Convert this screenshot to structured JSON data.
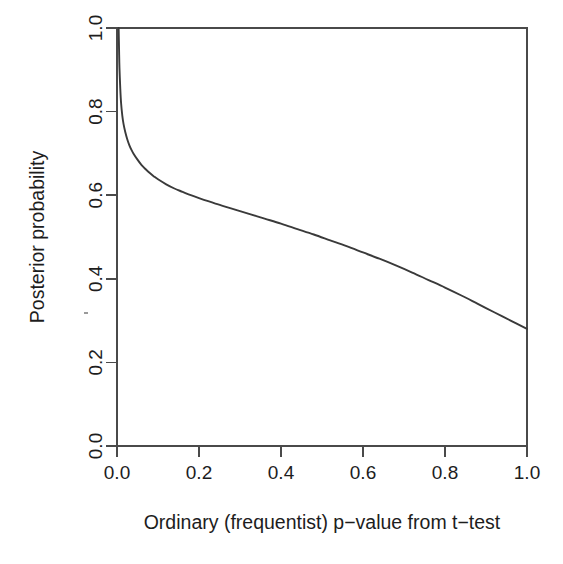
{
  "chart_data": {
    "type": "line",
    "title": "",
    "xlabel": "Ordinary (frequentist) p−value from t−test",
    "ylabel": "Posterior probability",
    "xlim": [
      0.0,
      1.0
    ],
    "ylim": [
      0.0,
      1.0
    ],
    "grid": false,
    "legend": null,
    "xticks": [
      "0.0",
      "0.2",
      "0.4",
      "0.6",
      "0.8",
      "1.0"
    ],
    "xtick_values": [
      0.0,
      0.2,
      0.4,
      0.6,
      0.8,
      1.0
    ],
    "yticks": [
      "0.0",
      "0.2",
      "0.4",
      "0.6",
      "0.8",
      "1.0"
    ],
    "ytick_values": [
      0.0,
      0.2,
      0.4,
      0.6,
      0.8,
      1.0
    ],
    "series": [
      {
        "name": "Posterior probability of null hypothesis",
        "x": [
          0.004,
          0.005,
          0.006,
          0.008,
          0.01,
          0.013,
          0.016,
          0.02,
          0.025,
          0.03,
          0.035,
          0.04,
          0.05,
          0.06,
          0.07,
          0.08,
          0.09,
          0.1,
          0.12,
          0.14,
          0.16,
          0.18,
          0.2,
          0.24,
          0.28,
          0.32,
          0.36,
          0.4,
          0.44,
          0.48,
          0.52,
          0.56,
          0.6,
          0.64,
          0.68,
          0.72,
          0.76,
          0.8,
          0.84,
          0.88,
          0.92,
          0.96,
          1.0
        ],
        "y": [
          1.0,
          0.95,
          0.905,
          0.855,
          0.82,
          0.79,
          0.77,
          0.752,
          0.734,
          0.72,
          0.709,
          0.7,
          0.685,
          0.672,
          0.662,
          0.653,
          0.645,
          0.638,
          0.626,
          0.616,
          0.608,
          0.6,
          0.593,
          0.58,
          0.568,
          0.556,
          0.544,
          0.532,
          0.519,
          0.506,
          0.492,
          0.478,
          0.463,
          0.448,
          0.432,
          0.415,
          0.397,
          0.379,
          0.36,
          0.34,
          0.32,
          0.3,
          0.28
        ]
      }
    ],
    "annotations": [],
    "colors": {
      "curve": "#3a3a3a",
      "axis": "#4a4a4a",
      "background": "#ffffff",
      "text": "#1d1d1d"
    }
  },
  "plot_geometry": {
    "left": 117,
    "right": 527,
    "top": 28,
    "bottom": 446
  }
}
